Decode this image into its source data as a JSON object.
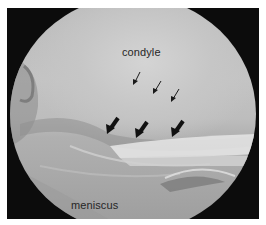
{
  "figure": {
    "type": "arthroscopic-image",
    "labels": {
      "condyle": "condyle",
      "meniscus": "meniscus"
    },
    "annotations": {
      "thin_arrows": [
        {
          "tip_x": 134,
          "tip_y": 84
        },
        {
          "tip_x": 155,
          "tip_y": 93
        },
        {
          "tip_x": 172,
          "tip_y": 101
        }
      ],
      "thick_arrows": [
        {
          "tip_x": 109,
          "tip_y": 132
        },
        {
          "tip_x": 138,
          "tip_y": 136
        },
        {
          "tip_x": 174,
          "tip_y": 135
        }
      ],
      "thin_arrow_count": 3,
      "thick_arrow_count": 3
    },
    "colors": {
      "frame_background": "#0c0c0c",
      "label_text": "#262626",
      "arrow": "#111111"
    }
  }
}
